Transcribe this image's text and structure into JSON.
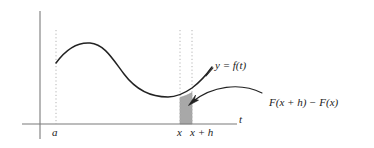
{
  "figure": {
    "background_color": "#ffffff",
    "axis_color": "#7a7a7a",
    "curve_color": "#222222",
    "dotted_color": "#b0b0b0",
    "shade_color": "#a8a8a8",
    "shade_edge_color": "#8a8a8a",
    "annotation_color": "#222222"
  },
  "axes": {
    "horizontal_axis_label": "t",
    "vertical_axis_label": "",
    "horizontal_axis": {
      "y": 124,
      "x_start": 22,
      "x_end": 237
    },
    "vertical_axis": {
      "x": 40,
      "y_start": 11,
      "y_end": 139
    }
  },
  "tick_labels": {
    "a": "a",
    "x": "x",
    "x_plus_h": "x + h"
  },
  "curve": {
    "label": "y = f(t)",
    "label_parts": {
      "y": "y",
      "equals": "=",
      "f_of_t": "f(t)"
    },
    "start_point": {
      "t": "a",
      "px": [
        56,
        63
      ]
    },
    "peak_point": {
      "px": [
        90,
        43
      ]
    },
    "trough_point": {
      "px": [
        176,
        96
      ]
    },
    "end_point": {
      "px": [
        212,
        68
      ]
    }
  },
  "shaded_region": {
    "label": "F(x + h) − F(x)",
    "left_bound": "x",
    "right_bound": "x + h",
    "left_px": 180,
    "right_px": 192,
    "top_px": 96,
    "bottom_px": 124,
    "meaning": "area under f between x and x+h"
  },
  "dotted_guides": [
    {
      "name": "guide-a",
      "x_px": 56,
      "top_px": 30,
      "bottom_px": 124,
      "label": "a"
    },
    {
      "name": "guide-x",
      "x_px": 180,
      "top_px": 30,
      "bottom_px": 124,
      "label": "x"
    },
    {
      "name": "guide-x-plus-h",
      "x_px": 192,
      "top_px": 30,
      "bottom_px": 124,
      "label": "x + h"
    }
  ],
  "annotation_arrow": {
    "name": "area-callout-arrow",
    "from_px": [
      262,
      93
    ],
    "to_px": [
      188,
      108
    ],
    "points_to": "shaded_region"
  }
}
